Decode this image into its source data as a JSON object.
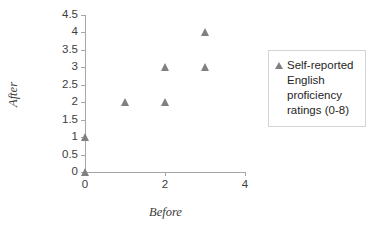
{
  "chart_data": {
    "type": "scatter",
    "title": "",
    "xlabel": "Before",
    "ylabel": "After",
    "xlim": [
      0,
      4
    ],
    "ylim": [
      0,
      4.5
    ],
    "xticks": [
      0,
      2,
      4
    ],
    "xtick_labels": [
      "0",
      "2",
      "4"
    ],
    "yticks": [
      0,
      0.5,
      1,
      1.5,
      2,
      2.5,
      3,
      3.5,
      4,
      4.5
    ],
    "ytick_labels": [
      "0",
      "0.5",
      "1",
      "1.5",
      "2",
      "2.5",
      "3",
      "3.5",
      "4",
      "4.5"
    ],
    "grid": false,
    "legend_position": "right",
    "marker": "triangle",
    "marker_color": "#808080",
    "axis_color": "#a6a6a6",
    "series": [
      {
        "name": "Self-reported English proficiency ratings (0-8)",
        "points": [
          {
            "x": 0,
            "y": 0
          },
          {
            "x": 0,
            "y": 1
          },
          {
            "x": 1,
            "y": 2
          },
          {
            "x": 2,
            "y": 2
          },
          {
            "x": 2,
            "y": 3
          },
          {
            "x": 3,
            "y": 3
          },
          {
            "x": 3,
            "y": 4
          }
        ]
      }
    ]
  },
  "legend": {
    "entries": [
      {
        "label": "Self-reported English proficiency ratings (0-8)"
      }
    ]
  }
}
